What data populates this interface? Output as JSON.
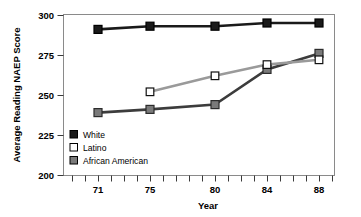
{
  "chart_data": {
    "type": "line",
    "title": "",
    "xlabel": "Year",
    "ylabel": "Average Reading NAEP Score",
    "x": [
      71,
      75,
      80,
      84,
      88
    ],
    "xtick_labels": [
      "71",
      "75",
      "80",
      "84",
      "88"
    ],
    "ytick_labels": [
      "200",
      "225",
      "250",
      "275",
      "300"
    ],
    "ylim": [
      200,
      300
    ],
    "xlim": [
      69,
      90
    ],
    "grid": false,
    "legend_position": "bottom-left",
    "series": [
      {
        "name": "White",
        "marker": "filled-square",
        "color": "#1a1a1a",
        "x": [
          71,
          75,
          80,
          84,
          88
        ],
        "values": [
          291,
          293,
          293,
          295,
          295
        ]
      },
      {
        "name": "Latino",
        "marker": "open-square",
        "color": "#ffffff",
        "line_color": "#9a9a9a",
        "x": [
          75,
          80,
          84,
          88
        ],
        "values": [
          252,
          262,
          269,
          272
        ]
      },
      {
        "name": "African American",
        "marker": "filled-square",
        "color": "#7a7a7a",
        "line_color": "#3c3c3c",
        "x": [
          71,
          75,
          80,
          84,
          88
        ],
        "values": [
          239,
          241,
          244,
          266,
          276
        ]
      }
    ],
    "legend": [
      {
        "label": "White",
        "marker": "filled-square",
        "color": "#1a1a1a"
      },
      {
        "label": "Latino",
        "marker": "open-square",
        "color": "#ffffff"
      },
      {
        "label": "African American",
        "marker": "filled-square",
        "color": "#7a7a7a"
      }
    ]
  }
}
